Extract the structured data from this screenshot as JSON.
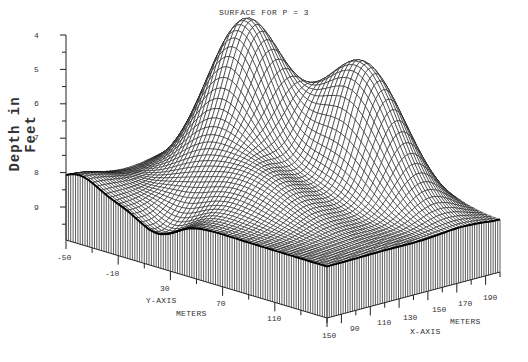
{
  "chart_data": {
    "type": "surface",
    "title": "SURFACE FOR P = 3",
    "zlabel": "Depth in Feet",
    "xlabel": "X-AXIS",
    "xunit": "METERS",
    "ylabel": "Y-AXIS",
    "yunit": "METERS",
    "z_ticks": [
      "4",
      "5",
      "6",
      "7",
      "8",
      "9"
    ],
    "z_range": [
      4,
      10
    ],
    "z_inverted": true,
    "y_ticks": [
      "-50",
      "-10",
      "30",
      "70",
      "110",
      "150"
    ],
    "y_range": [
      -50,
      150
    ],
    "x_ticks": [
      "90",
      "110",
      "130",
      "150",
      "170",
      "190"
    ],
    "x_range": [
      70,
      200
    ],
    "base_depth": 8.3,
    "features": [
      {
        "name": "left-peak",
        "x": 120,
        "y": 20,
        "depth_min": 4.0
      },
      {
        "name": "right-peak",
        "x": 160,
        "y": 100,
        "depth_min": 4.4
      },
      {
        "name": "saddle-bump",
        "x": 155,
        "y": 55,
        "depth_min": 5.8
      }
    ],
    "grid": false,
    "style": "wireframe mesh with vertical skirt"
  }
}
